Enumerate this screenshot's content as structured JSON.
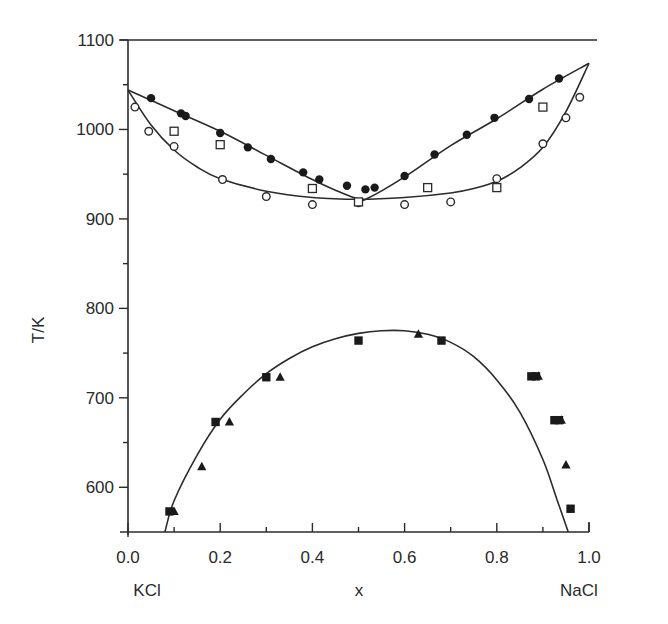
{
  "chart_data": {
    "type": "scatter",
    "title": "",
    "xlabel": "x",
    "ylabel": "T/K",
    "xlim": [
      0.0,
      1.0
    ],
    "ylim": [
      550,
      1100
    ],
    "grid": false,
    "legend": null,
    "x_ticks": [
      "0.0",
      "0.2",
      "0.4",
      "0.6",
      "0.8",
      "1.0"
    ],
    "y_ticks": [
      "600",
      "700",
      "800",
      "900",
      "1000",
      "1100"
    ],
    "x_end_labels": {
      "left": "KCl",
      "right": "NaCl"
    },
    "series": [
      {
        "name": "liquidus (filled circles)",
        "marker": "filled-circle",
        "points": [
          [
            0.05,
            1035
          ],
          [
            0.115,
            1018
          ],
          [
            0.125,
            1015
          ],
          [
            0.2,
            996
          ],
          [
            0.26,
            980
          ],
          [
            0.31,
            967
          ],
          [
            0.38,
            952
          ],
          [
            0.415,
            944
          ],
          [
            0.475,
            937
          ],
          [
            0.515,
            933
          ],
          [
            0.535,
            935
          ],
          [
            0.6,
            948
          ],
          [
            0.665,
            972
          ],
          [
            0.735,
            994
          ],
          [
            0.795,
            1013
          ],
          [
            0.87,
            1034
          ],
          [
            0.935,
            1057
          ]
        ]
      },
      {
        "name": "solidus (open circles)",
        "marker": "open-circle",
        "points": [
          [
            0.015,
            1025
          ],
          [
            0.045,
            998
          ],
          [
            0.1,
            981
          ],
          [
            0.205,
            944
          ],
          [
            0.3,
            925
          ],
          [
            0.4,
            916
          ],
          [
            0.5,
            918
          ],
          [
            0.6,
            916
          ],
          [
            0.7,
            919
          ],
          [
            0.8,
            945
          ],
          [
            0.9,
            984
          ],
          [
            0.95,
            1013
          ],
          [
            0.98,
            1036
          ]
        ]
      },
      {
        "name": "open squares",
        "marker": "open-square",
        "points": [
          [
            0.1,
            998
          ],
          [
            0.2,
            983
          ],
          [
            0.4,
            934
          ],
          [
            0.5,
            919
          ],
          [
            0.65,
            935
          ],
          [
            0.8,
            935
          ],
          [
            0.9,
            1025
          ]
        ]
      },
      {
        "name": "miscibility gap (filled squares)",
        "marker": "filled-square",
        "points": [
          [
            0.09,
            573
          ],
          [
            0.19,
            673
          ],
          [
            0.3,
            723
          ],
          [
            0.5,
            764
          ],
          [
            0.68,
            764
          ],
          [
            0.875,
            724
          ],
          [
            0.885,
            724
          ],
          [
            0.925,
            675
          ],
          [
            0.935,
            675
          ],
          [
            0.96,
            576
          ]
        ]
      },
      {
        "name": "miscibility gap (filled triangles)",
        "marker": "filled-triangle",
        "points": [
          [
            0.1,
            573
          ],
          [
            0.16,
            623
          ],
          [
            0.22,
            673
          ],
          [
            0.33,
            723
          ],
          [
            0.63,
            771
          ],
          [
            0.89,
            724
          ],
          [
            0.94,
            675
          ],
          [
            0.95,
            625
          ]
        ]
      }
    ],
    "curves": [
      {
        "name": "liquidus line",
        "points": [
          [
            0.0,
            1044
          ],
          [
            0.1,
            1021
          ],
          [
            0.2,
            998
          ],
          [
            0.3,
            971
          ],
          [
            0.4,
            944
          ],
          [
            0.45,
            932
          ],
          [
            0.5,
            922
          ],
          [
            0.52,
            923
          ],
          [
            0.6,
            947
          ],
          [
            0.7,
            982
          ],
          [
            0.8,
            1012
          ],
          [
            0.9,
            1045
          ],
          [
            1.0,
            1074
          ]
        ]
      },
      {
        "name": "solidus line",
        "points": [
          [
            0.0,
            1044
          ],
          [
            0.05,
            1005
          ],
          [
            0.1,
            977
          ],
          [
            0.15,
            958
          ],
          [
            0.2,
            945
          ],
          [
            0.3,
            931
          ],
          [
            0.4,
            924
          ],
          [
            0.5,
            922
          ],
          [
            0.6,
            924
          ],
          [
            0.7,
            929
          ],
          [
            0.75,
            934
          ],
          [
            0.8,
            942
          ],
          [
            0.85,
            957
          ],
          [
            0.9,
            980
          ],
          [
            0.95,
            1020
          ],
          [
            1.0,
            1074
          ]
        ]
      },
      {
        "name": "miscibility gap line",
        "points": [
          [
            0.08,
            550
          ],
          [
            0.1,
            585
          ],
          [
            0.15,
            636
          ],
          [
            0.2,
            676
          ],
          [
            0.25,
            704
          ],
          [
            0.3,
            727
          ],
          [
            0.35,
            744
          ],
          [
            0.4,
            757
          ],
          [
            0.45,
            766
          ],
          [
            0.5,
            772
          ],
          [
            0.55,
            775
          ],
          [
            0.6,
            775
          ],
          [
            0.65,
            771
          ],
          [
            0.7,
            762
          ],
          [
            0.75,
            746
          ],
          [
            0.8,
            720
          ],
          [
            0.85,
            684
          ],
          [
            0.9,
            631
          ],
          [
            0.93,
            587
          ],
          [
            0.955,
            550
          ]
        ]
      }
    ]
  }
}
